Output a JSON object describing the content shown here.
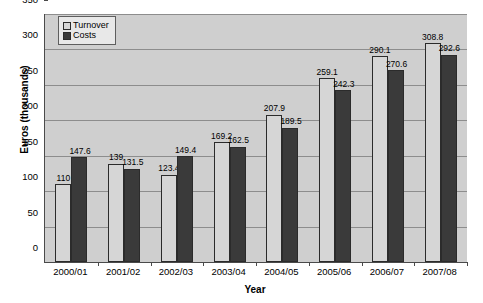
{
  "chart_data": {
    "type": "bar",
    "title": "",
    "xlabel": "Year",
    "ylabel": "Euros (thousands)",
    "ylim": [
      0,
      350
    ],
    "ytick_step": 50,
    "yticks": [
      0,
      50,
      100,
      150,
      200,
      250,
      300,
      350
    ],
    "grid": "horizontal",
    "legend_position": "top-left",
    "categories": [
      "2000/01",
      "2001/02",
      "2002/03",
      "2003/04",
      "2004/05",
      "2005/06",
      "2006/07",
      "2007/08"
    ],
    "series": [
      {
        "name": "Turnover",
        "color": "#d6d6d6",
        "values": [
          110,
          139,
          123.4,
          169.2,
          207.9,
          259.1,
          290.1,
          308.8
        ],
        "labels": [
          "110",
          "139",
          "123.4",
          "169.2",
          "207.9",
          "259.1",
          "290.1",
          "308.8"
        ]
      },
      {
        "name": "Costs",
        "color": "#3a3a3a",
        "values": [
          147.6,
          131.5,
          149.4,
          162.5,
          189.5,
          242.3,
          270.6,
          292.6
        ],
        "labels": [
          "147.6",
          "131.5",
          "149.4",
          "162.5",
          "189.5",
          "242.3",
          "270.6",
          "292.6"
        ]
      }
    ]
  },
  "legend": {
    "items": [
      {
        "label": "Turnover",
        "swatch_class": "turnover"
      },
      {
        "label": "Costs",
        "swatch_class": "costs"
      }
    ]
  },
  "axes": {
    "y_title": "Euros (thousands)",
    "x_title": "Year"
  },
  "colors": {
    "plot_background": "#cfcfcf",
    "gridline": "#8d8d8d",
    "axis_line": "#4a4a4a",
    "bar_outline": "#2b2b2b",
    "turnover": "#d6d6d6",
    "costs": "#3a3a3a",
    "legend_background": "#e8e8e8",
    "page_background": "#ffffff"
  }
}
